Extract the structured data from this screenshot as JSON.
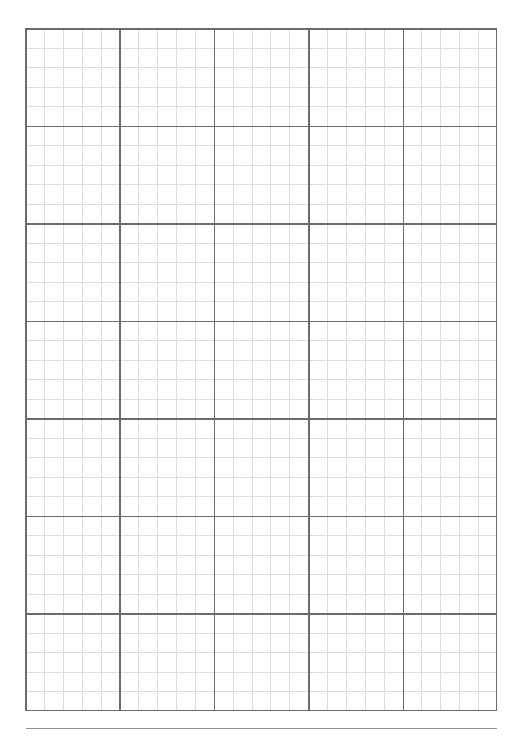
{
  "document": {
    "title": "Graph Paper",
    "page_width": 523,
    "page_height": 737,
    "background_color": "#ffffff"
  },
  "grid": {
    "name": "graph-paper-grid",
    "left": 25,
    "top": 28,
    "width": 472,
    "height": 683,
    "major_columns": 5,
    "major_rows": 7,
    "minor_per_major": 5,
    "minor_columns": 25,
    "minor_rows": 35,
    "minor_cell_width": 18.88,
    "minor_cell_height": 19.514,
    "major_cell_width": 94.4,
    "major_cell_height": 97.571,
    "minor_line_color": "#dcdcdc",
    "major_line_color": "#6b6b6b",
    "border_color": "#6b6b6b",
    "minor_line_width": 1,
    "major_line_width": 1.6,
    "fill_color": "#ffffff"
  },
  "footer_rule": {
    "name": "bottom-horizontal-rule",
    "left": 26,
    "top": 728,
    "width": 471,
    "color": "#8f8f8f",
    "thickness": 1.2
  }
}
